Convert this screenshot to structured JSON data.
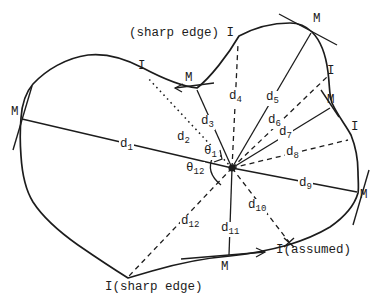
{
  "colors": {
    "background": "#ffffff",
    "ink": "#1c1c1c"
  },
  "notes": {
    "top_sharp_edge": "(sharp edge) I",
    "bottom_sharp_edge": "I(sharp edge)",
    "assumed": "I(assumed)"
  },
  "d_labels": [
    {
      "base": "d",
      "sub": "1"
    },
    {
      "base": "d",
      "sub": "2"
    },
    {
      "base": "d",
      "sub": "3"
    },
    {
      "base": "d",
      "sub": "4"
    },
    {
      "base": "d",
      "sub": "5"
    },
    {
      "base": "d",
      "sub": "6"
    },
    {
      "base": "d",
      "sub": "7"
    },
    {
      "base": "d",
      "sub": "8"
    },
    {
      "base": "d",
      "sub": "9"
    },
    {
      "base": "d",
      "sub": "10"
    },
    {
      "base": "d",
      "sub": "11"
    },
    {
      "base": "d",
      "sub": "12"
    }
  ],
  "theta_labels": [
    {
      "base": "θ",
      "sub": "1"
    },
    {
      "base": "θ",
      "sub": "12"
    }
  ],
  "m_labels": {
    "left": "M",
    "top_dip": "M",
    "top_right": "M",
    "right_upper": "M",
    "right": "M",
    "bottom": "M"
  },
  "i_labels": {
    "top_left": "I",
    "right_upper": "I",
    "right_lower": "I"
  }
}
